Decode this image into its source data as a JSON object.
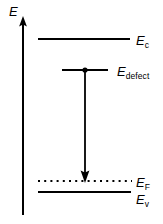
{
  "figure": {
    "width": 163,
    "height": 224,
    "background_color": "#ffffff",
    "ink_color": "#000000"
  },
  "axis": {
    "name": "energy-axis",
    "label_base": "E",
    "label_sub": "",
    "orientation": "vertical",
    "direction": "up",
    "x": 23,
    "y_bottom": 215,
    "y_top": 18
  },
  "levels": [
    {
      "id": "conduction-band",
      "label_base": "E",
      "label_sub": "c",
      "style": "solid",
      "x_start": 38,
      "x_end": 130,
      "y": 39
    },
    {
      "id": "defect-level",
      "label_base": "E",
      "label_sub": "defect",
      "style": "solid",
      "x_start": 62,
      "x_end": 108,
      "y": 70,
      "marker": "dot",
      "marker_x": 85
    },
    {
      "id": "fermi-level",
      "label_base": "E",
      "label_sub": "F",
      "style": "dotted",
      "x_start": 38,
      "x_end": 132,
      "y": 181
    },
    {
      "id": "valence-band",
      "label_base": "E",
      "label_sub": "v",
      "style": "solid",
      "x_start": 38,
      "x_end": 131,
      "y": 192
    }
  ],
  "transition_arrow": {
    "id": "defect-to-fermi-transition",
    "x": 85,
    "y_start": 70,
    "y_end": 182,
    "direction": "down"
  }
}
